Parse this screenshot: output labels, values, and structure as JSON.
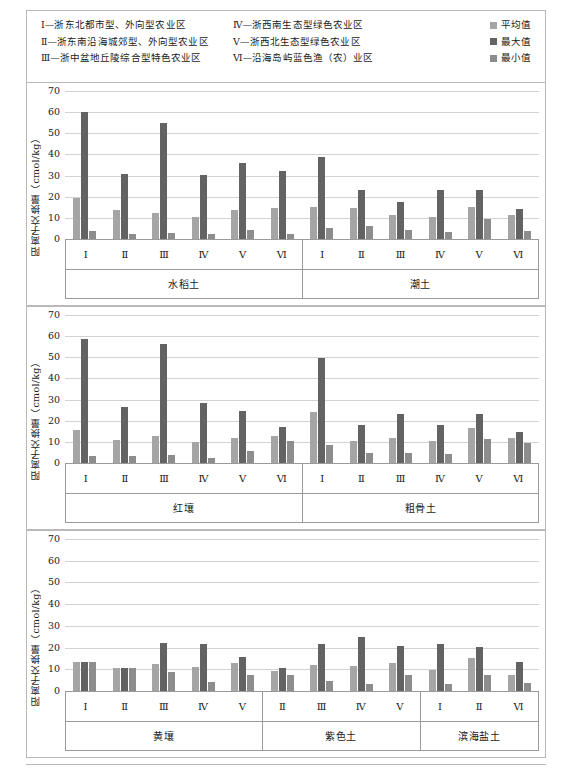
{
  "region_key": {
    "column1": [
      "Ⅰ—浙东北都市型、外向型农业区",
      "Ⅱ—浙东南沿海城郊型、外向型农业区",
      "Ⅲ—浙中盆地丘陵综合型特色农业区"
    ],
    "column2": [
      "Ⅳ—浙西南生态型绿色农业区",
      "Ⅴ—浙西北生态型绿色农业区",
      "Ⅵ—沿海岛屿蓝色渔（农）业区"
    ]
  },
  "series_legend": [
    {
      "label": "平均值",
      "color": "#a5a5a5",
      "key": "mean"
    },
    {
      "label": "最大值",
      "color": "#636363",
      "key": "max"
    },
    {
      "label": "最小值",
      "color": "#8d8d8d",
      "key": "min"
    }
  ],
  "axis": {
    "ylabel": "阳离子交换量（cmol/kg）",
    "ticks": [
      0,
      10,
      20,
      30,
      40,
      50,
      60,
      70
    ],
    "ylim": [
      0,
      70
    ],
    "grid": true
  },
  "chart_data": {
    "type": "bar",
    "title": "",
    "xlabel": "",
    "ylabel": "阳离子交换量（cmol/kg）",
    "ylim": [
      0,
      70
    ],
    "yticks": [
      0,
      10,
      20,
      30,
      40,
      50,
      60,
      70
    ],
    "grid": true,
    "legend_position": "top-right",
    "series_names": [
      "平均值",
      "最大值",
      "最小值"
    ],
    "panels": [
      {
        "panel_index": 0,
        "groups": [
          {
            "name": "水稻土",
            "categories": [
              "Ⅰ",
              "Ⅱ",
              "Ⅲ",
              "Ⅳ",
              "Ⅴ",
              "Ⅵ"
            ],
            "series": [
              {
                "name": "平均值",
                "values": [
                  19.3,
                  13.9,
                  12.3,
                  10.2,
                  13.6,
                  14.7
                ]
              },
              {
                "name": "最大值",
                "values": [
                  60.2,
                  30.9,
                  55.0,
                  30.3,
                  35.9,
                  32.3
                ]
              },
              {
                "name": "最小值",
                "values": [
                  4.0,
                  2.4,
                  2.9,
                  2.3,
                  4.1,
                  2.3
                ]
              }
            ]
          },
          {
            "name": "潮土",
            "categories": [
              "Ⅰ",
              "Ⅱ",
              "Ⅲ",
              "Ⅳ",
              "Ⅴ",
              "Ⅵ"
            ],
            "series": [
              {
                "name": "平均值",
                "values": [
                  15.0,
                  14.6,
                  11.3,
                  10.2,
                  15.0,
                  11.5
                ]
              },
              {
                "name": "最大值",
                "values": [
                  38.6,
                  23.2,
                  17.5,
                  23.3,
                  23.3,
                  14.2
                ]
              },
              {
                "name": "最小值",
                "values": [
                  5.2,
                  6.1,
                  4.4,
                  3.3,
                  9.4,
                  4.0
                ]
              }
            ]
          }
        ]
      },
      {
        "panel_index": 1,
        "groups": [
          {
            "name": "红壤",
            "categories": [
              "Ⅰ",
              "Ⅱ",
              "Ⅲ",
              "Ⅳ",
              "Ⅴ",
              "Ⅵ"
            ],
            "series": [
              {
                "name": "平均值",
                "values": [
                  15.6,
                  10.8,
                  13.0,
                  9.8,
                  12.0,
                  12.7
                ]
              },
              {
                "name": "最大值",
                "values": [
                  58.8,
                  26.3,
                  56.2,
                  28.5,
                  24.6,
                  17.1
                ]
              },
              {
                "name": "最小值",
                "values": [
                  3.2,
                  3.1,
                  3.9,
                  2.3,
                  5.9,
                  10.5
                ]
              }
            ]
          },
          {
            "name": "粗骨土",
            "categories": [
              "Ⅰ",
              "Ⅱ",
              "Ⅲ",
              "Ⅳ",
              "Ⅴ",
              "Ⅵ"
            ],
            "series": [
              {
                "name": "平均值",
                "values": [
                  24.0,
                  10.2,
                  11.8,
                  10.4,
                  16.6,
                  11.9
                ]
              },
              {
                "name": "最大值",
                "values": [
                  49.6,
                  17.9,
                  23.2,
                  18.0,
                  23.0,
                  14.5
                ]
              },
              {
                "name": "最小值",
                "values": [
                  8.7,
                  4.9,
                  4.9,
                  4.3,
                  11.2,
                  9.6
                ]
              }
            ]
          }
        ]
      },
      {
        "panel_index": 2,
        "groups": [
          {
            "name": "黄壤",
            "categories": [
              "Ⅰ",
              "Ⅱ",
              "Ⅲ",
              "Ⅳ",
              "Ⅴ"
            ],
            "series": [
              {
                "name": "平均值",
                "values": [
                  13.2,
                  10.4,
                  12.3,
                  11.0,
                  13.1
                ]
              },
              {
                "name": "最大值",
                "values": [
                  13.3,
                  10.6,
                  22.3,
                  21.5,
                  15.5
                ]
              },
              {
                "name": "最小值",
                "values": [
                  13.3,
                  10.6,
                  8.6,
                  4.1,
                  7.4
                ]
              }
            ]
          },
          {
            "name": "紫色土",
            "categories": [
              "Ⅱ",
              "Ⅲ",
              "Ⅳ",
              "Ⅴ"
            ],
            "series": [
              {
                "name": "平均值",
                "values": [
                  9.2,
                  11.9,
                  11.5,
                  12.8
                ]
              },
              {
                "name": "最大值",
                "values": [
                  10.6,
                  21.7,
                  25.1,
                  20.8
                ]
              },
              {
                "name": "最小值",
                "values": [
                  7.5,
                  4.4,
                  3.4,
                  7.5
                ]
              }
            ]
          },
          {
            "name": "滨海盐土",
            "categories": [
              "Ⅰ",
              "Ⅱ",
              "Ⅵ"
            ],
            "series": [
              {
                "name": "平均值",
                "values": [
                  9.6,
                  15.3,
                  7.3
                ]
              },
              {
                "name": "最大值",
                "values": [
                  21.8,
                  20.4,
                  13.2
                ]
              },
              {
                "name": "最小值",
                "values": [
                  3.3,
                  7.5,
                  3.6
                ]
              }
            ]
          }
        ]
      }
    ]
  }
}
